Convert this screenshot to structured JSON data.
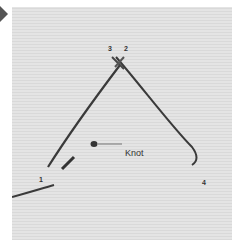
{
  "figure": {
    "pointer_icon": "triangle-right-icon",
    "labels": {
      "point_1": "1",
      "point_2": "2",
      "point_3": "3",
      "point_4": "4",
      "knot": "Knot"
    },
    "colors": {
      "background": "#e0e0e0",
      "thread": "#333333",
      "pointer": "#555555"
    }
  }
}
